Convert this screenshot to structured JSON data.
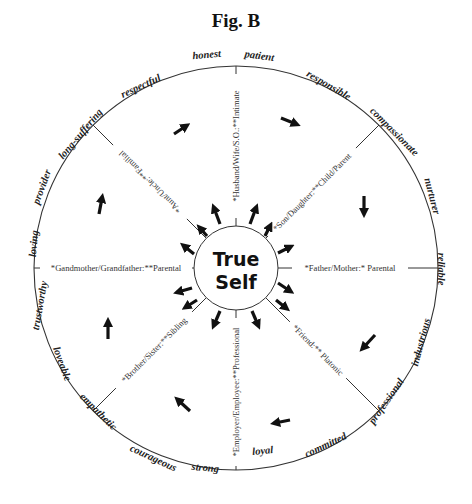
{
  "figure": {
    "title": "Fig. B",
    "center_label_line1": "True",
    "center_label_line2": "Self",
    "colors": {
      "ink": "#222222",
      "line": "#333333",
      "background": "#ffffff"
    }
  },
  "spokes": [
    {
      "label": "*Husband/Wife/S.O.:**Intimate",
      "angle_deg": -90
    },
    {
      "label": "*Son/Daughter:**Child/Parent",
      "angle_deg": -45
    },
    {
      "label": "*Father/Mother:* Parental",
      "angle_deg": 0
    },
    {
      "label": "*Friend:** Platonic",
      "angle_deg": 45
    },
    {
      "label": "*Employer/Employee:**Professional",
      "angle_deg": 90
    },
    {
      "label": "*Brother/Sister:**Sibling",
      "angle_deg": 135
    },
    {
      "label": "*Gandmother/Grandfather:**Parental",
      "angle_deg": 180
    },
    {
      "label": "*Aunt/Uncle:**Familial",
      "angle_deg": 225
    }
  ],
  "traits": [
    "honest",
    "patient",
    "responsible",
    "compassionate",
    "nurturer",
    "reliable",
    "industrious",
    "professional",
    "committed",
    "loyal",
    "strong",
    "courageous",
    "empathetic",
    "loveable",
    "trustworthy",
    "loving",
    "provider",
    "long-suffering",
    "respectful"
  ]
}
